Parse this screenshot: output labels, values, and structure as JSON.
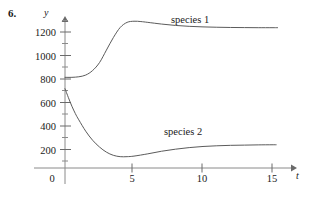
{
  "figure": {
    "problem_number": "6.",
    "y_axis_label": "y",
    "x_axis_label": "t"
  },
  "annotations": {
    "species_1": "species 1",
    "species_2": "species 2"
  },
  "chart_data": {
    "type": "line",
    "title": "",
    "xlabel": "t",
    "ylabel": "y",
    "xlim": [
      0,
      16
    ],
    "ylim": [
      0,
      1350
    ],
    "grid": false,
    "legend_position": "inline-annotations",
    "line_color": "#5b5b5b",
    "axis_color": "#8a8a8a",
    "xticks": [
      0,
      5,
      10,
      15
    ],
    "xtick_labels": [
      "0",
      "5",
      "10",
      "15"
    ],
    "yticks": [
      200,
      400,
      600,
      800,
      1000,
      1200
    ],
    "ytick_labels": [
      "200",
      "400",
      "600",
      "800",
      "1000",
      "1200"
    ],
    "yminor_ticks": [
      100,
      300,
      500,
      700,
      900,
      1100,
      1300
    ],
    "series": [
      {
        "name": "species 1",
        "x": [
          0,
          0.5,
          1,
          1.5,
          2,
          2.5,
          3,
          3.5,
          4,
          4.5,
          5,
          5.5,
          6,
          7,
          8,
          9,
          10,
          11,
          12,
          13,
          14,
          15,
          15.4
        ],
        "values": [
          800,
          800,
          805,
          820,
          860,
          930,
          1040,
          1150,
          1240,
          1285,
          1295,
          1292,
          1285,
          1270,
          1258,
          1250,
          1245,
          1242,
          1240,
          1239,
          1238,
          1238,
          1238
        ]
      },
      {
        "name": "species 2",
        "x": [
          0,
          0.25,
          0.5,
          0.75,
          1,
          1.5,
          2,
          2.5,
          3,
          3.5,
          4,
          4.5,
          5,
          6,
          7,
          8,
          9,
          10,
          11,
          12,
          13,
          14,
          15,
          15.3
        ],
        "values": [
          700,
          620,
          545,
          480,
          425,
          325,
          245,
          185,
          140,
          112,
          100,
          100,
          105,
          125,
          148,
          166,
          180,
          190,
          196,
          200,
          202,
          204,
          205,
          205
        ]
      }
    ]
  }
}
